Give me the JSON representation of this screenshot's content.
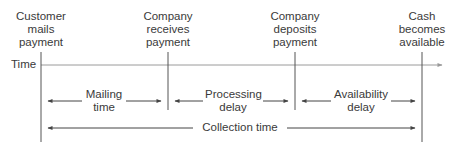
{
  "diagram": {
    "title": "",
    "axis_label": "Time",
    "events": [
      {
        "id": "customer-mails",
        "lines": [
          "Customer",
          "mails",
          "payment"
        ]
      },
      {
        "id": "company-receives",
        "lines": [
          "Company",
          "receives",
          "payment"
        ]
      },
      {
        "id": "company-deposits",
        "lines": [
          "Company",
          "deposits",
          "payment"
        ]
      },
      {
        "id": "cash-available",
        "lines": [
          "Cash",
          "becomes",
          "available"
        ]
      }
    ],
    "intervals": [
      {
        "id": "mailing-time",
        "lines": [
          "Mailing",
          "time"
        ]
      },
      {
        "id": "processing-delay",
        "lines": [
          "Processing",
          "delay"
        ]
      },
      {
        "id": "availability-delay",
        "lines": [
          "Availability",
          "delay"
        ]
      }
    ],
    "total": {
      "id": "collection-time",
      "label": "Collection time"
    },
    "colors": {
      "line": "#555555",
      "timeline": "#9a9a9a",
      "text": "#3a3a3a"
    }
  }
}
